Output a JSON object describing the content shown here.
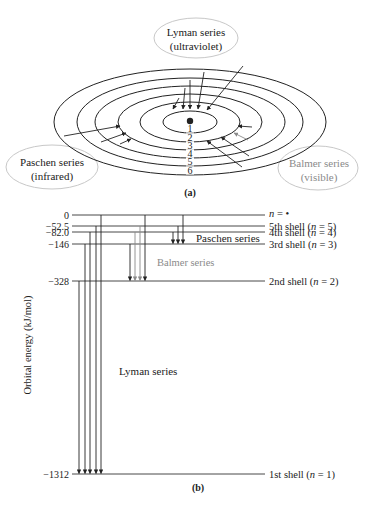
{
  "part_a": {
    "caption": "(a)",
    "nucleus": {
      "cx": 190,
      "cy": 121,
      "r": 3.2
    },
    "shells": [
      {
        "n": "1",
        "rx": 27,
        "ry": 11
      },
      {
        "n": "2",
        "rx": 50,
        "ry": 20
      },
      {
        "n": "3",
        "rx": 72,
        "ry": 28
      },
      {
        "n": "4",
        "rx": 95,
        "ry": 36
      },
      {
        "n": "5",
        "rx": 113,
        "ry": 44
      },
      {
        "n": "6",
        "rx": 136,
        "ry": 53
      }
    ],
    "labels": {
      "lyman_line1": "Lyman series",
      "lyman_line2": "(ultraviolet)",
      "paschen_line1": "Paschen series",
      "paschen_line2": "(infrared)",
      "balmer_line1": "Balmer series",
      "balmer_line2": "(visible)"
    },
    "colors": {
      "line": "#222222",
      "balmer": "#8a8a8a",
      "balloon": "#c8c8c8"
    }
  },
  "part_b": {
    "caption": "(b)",
    "y_axis_label": "Orbital energy (kJ/mol)",
    "levels": [
      {
        "value": "0",
        "label": "n = •",
        "y": 215
      },
      {
        "value": "−52.5",
        "label": "5th shell (n = 5)",
        "y": 226
      },
      {
        "value": "−82.0",
        "label": "4th shell (n = 4)",
        "y": 232
      },
      {
        "value": "−146",
        "label": "3rd shell (n = 3)",
        "y": 244
      },
      {
        "value": "−328",
        "label": "2nd shell (n = 2)",
        "y": 281
      },
      {
        "value": "−1312",
        "label": "1st shell (n = 1)",
        "y": 474
      }
    ],
    "series": {
      "paschen": "Paschen series",
      "balmer": "Balmer series",
      "lyman": "Lyman series"
    },
    "transitions": {
      "lyman": [
        {
          "x": 79,
          "from": 281,
          "to": 474
        },
        {
          "x": 85,
          "from": 244,
          "to": 474
        },
        {
          "x": 90,
          "from": 232,
          "to": 474
        },
        {
          "x": 96,
          "from": 226,
          "to": 474
        },
        {
          "x": 101,
          "from": 215,
          "to": 474
        }
      ],
      "balmer": [
        {
          "x": 130,
          "from": 244,
          "to": 281
        },
        {
          "x": 135,
          "from": 232,
          "to": 281
        },
        {
          "x": 140,
          "from": 226,
          "to": 281
        },
        {
          "x": 145,
          "from": 215,
          "to": 281
        }
      ],
      "paschen": [
        {
          "x": 173,
          "from": 232,
          "to": 244
        },
        {
          "x": 178,
          "from": 226,
          "to": 244
        },
        {
          "x": 183,
          "from": 215,
          "to": 244
        }
      ]
    },
    "line_x_start": 72,
    "line_x_end": 265
  }
}
